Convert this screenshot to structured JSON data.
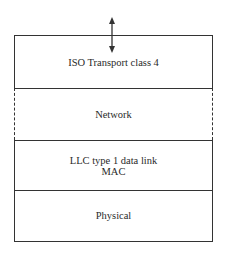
{
  "diagram": {
    "type": "protocol-stack",
    "layers": [
      {
        "id": "transport",
        "lines": [
          "ISO Transport class 4"
        ],
        "border": "solid"
      },
      {
        "id": "network",
        "lines": [
          "Network"
        ],
        "border": "dashed"
      },
      {
        "id": "datalink",
        "lines": [
          "LLC type 1 data link",
          "MAC"
        ],
        "border": "solid"
      },
      {
        "id": "physical",
        "lines": [
          "Physical"
        ],
        "border": "solid"
      }
    ],
    "arrow": {
      "direction": "bidirectional",
      "position": "top-of-transport"
    },
    "colors": {
      "line": "#333333",
      "text": "#2a2a2a",
      "background": "#ffffff"
    }
  }
}
